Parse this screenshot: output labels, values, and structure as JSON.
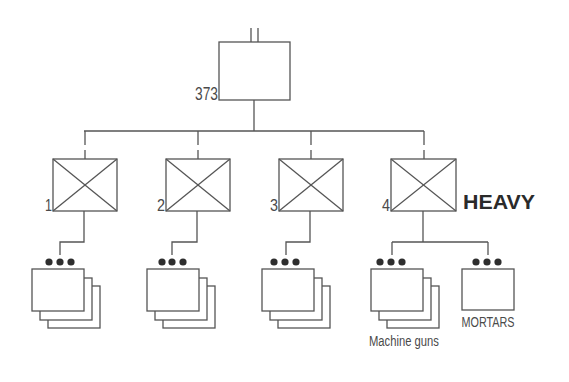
{
  "diagram": {
    "type": "military-organization-chart",
    "headquarters": {
      "designation": "373",
      "echelon_symbol": "||"
    },
    "companies": [
      {
        "number": "1",
        "symbol": "infantry"
      },
      {
        "number": "2",
        "symbol": "infantry"
      },
      {
        "number": "3",
        "symbol": "infantry"
      },
      {
        "number": "4",
        "symbol": "infantry",
        "modifier": "HEAVY"
      }
    ],
    "platoon_groups": [
      {
        "parent": "1",
        "echelon_symbol": "•••",
        "count_shown": 3,
        "label": ""
      },
      {
        "parent": "2",
        "echelon_symbol": "•••",
        "count_shown": 3,
        "label": ""
      },
      {
        "parent": "3",
        "echelon_symbol": "•••",
        "count_shown": 3,
        "label": ""
      },
      {
        "parent": "4",
        "echelon_symbol": "•••",
        "count_shown": 3,
        "label": "Machine guns"
      },
      {
        "parent": "4",
        "echelon_symbol": "•••",
        "count_shown": 1,
        "label": "MORTARS"
      }
    ],
    "colors": {
      "line": "#555555",
      "text": "#4a4a4a",
      "emphasis": "#2a2a2a",
      "background": "#ffffff"
    }
  }
}
